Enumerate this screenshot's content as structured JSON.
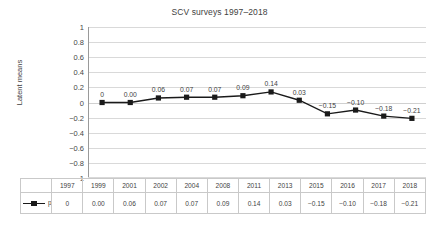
{
  "chart_data": {
    "type": "line",
    "title": "SCV surveys 1997–2018",
    "xlabel": "",
    "ylabel": "Latent means",
    "ylim": [
      -1,
      1
    ],
    "ytick_step": 0.2,
    "grid": true,
    "legend_position": "bottom-table",
    "categories": [
      "1997",
      "1999",
      "2001",
      "2002",
      "2004",
      "2008",
      "2011",
      "2013",
      "2015",
      "2016",
      "2017",
      "2018"
    ],
    "series": [
      {
        "name": "perceived ethnic threat",
        "values": [
          0,
          0.0,
          0.06,
          0.07,
          0.07,
          0.09,
          0.14,
          0.03,
          -0.15,
          -0.1,
          -0.18,
          -0.21
        ],
        "labels": [
          "0",
          "0.00",
          "0.06",
          "0.07",
          "0.07",
          "0.09",
          "0.14",
          "0.03",
          "−0.15",
          "−0.10",
          "−0.18",
          "−0.21"
        ],
        "color": "#1a1a1a",
        "marker": "square"
      }
    ],
    "ytick_labels": [
      "1",
      "0.8",
      "0.6",
      "0.4",
      "0.2",
      "0",
      "−0.2",
      "−0.4",
      "−0.6",
      "−0.8",
      "−1"
    ],
    "ytick_values": [
      1,
      0.8,
      0.6,
      0.4,
      0.2,
      0,
      -0.2,
      -0.4,
      -0.6,
      -0.8,
      -1
    ]
  },
  "table": {
    "legend_label": "perceived ethnic threat",
    "header_row": [
      "1997",
      "1999",
      "2001",
      "2002",
      "2004",
      "2008",
      "2011",
      "2013",
      "2015",
      "2016",
      "2017",
      "2018"
    ],
    "value_row": [
      "0",
      "0.00",
      "0.06",
      "0.07",
      "0.07",
      "0.09",
      "0.14",
      "0.03",
      "−0.15",
      "−0.10",
      "−0.18",
      "−0.21"
    ]
  },
  "colors": {
    "series": "#1a1a1a",
    "gridline": "#d9d9d9",
    "axis": "#9a9a9a",
    "text": "#3f3f3f",
    "table_border": "#c9c9c9"
  }
}
